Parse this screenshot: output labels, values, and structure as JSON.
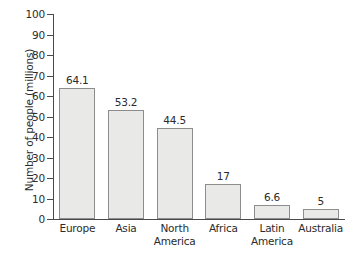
{
  "chart_data": {
    "type": "bar",
    "title": "",
    "subtitle": "",
    "xlabel": "",
    "ylabel": "Number of people (millions)",
    "categories": [
      "Europe",
      "Asia",
      "North America",
      "Africa",
      "Latin America",
      "Australia"
    ],
    "category_lines": [
      [
        "Europe"
      ],
      [
        "Asia"
      ],
      [
        "North",
        "America"
      ],
      [
        "Africa"
      ],
      [
        "Latin",
        "America"
      ],
      [
        "Australia"
      ]
    ],
    "values": [
      64.1,
      53.2,
      44.5,
      17,
      6.6,
      5
    ],
    "value_labels": [
      "64.1",
      "53.2",
      "44.5",
      "17",
      "6.6",
      "5"
    ],
    "ylim": [
      0,
      100
    ],
    "ytick_labels": [
      "0",
      "10",
      "20",
      "30",
      "40",
      "50",
      "60",
      "70",
      "80",
      "90",
      "100"
    ],
    "ytick_values": [
      0,
      10,
      20,
      30,
      40,
      50,
      60,
      70,
      80,
      90,
      100
    ],
    "grid": false,
    "legend": "none",
    "colors": {
      "bar_fill": "#e9e9e7",
      "bar_border": "#8d8d8d",
      "axis": "#4a4a4a",
      "text": "#2b2b2b",
      "background": "#ffffff"
    }
  }
}
